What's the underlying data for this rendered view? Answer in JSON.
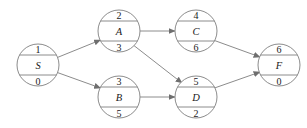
{
  "diagram": {
    "type": "activity-on-node-network",
    "background_color": "#ffffff",
    "node_stroke_color": "#8c8c8c",
    "edge_color": "#8c8c8c",
    "text_color": "#1a1a1a",
    "nodes": [
      {
        "id": "S",
        "top": "1",
        "middle": "S",
        "bottom": "0",
        "cx": 38,
        "cy": 65,
        "r": 21
      },
      {
        "id": "A",
        "top": "2",
        "middle": "A",
        "bottom": "3",
        "cx": 119,
        "cy": 31,
        "r": 21
      },
      {
        "id": "B",
        "top": "3",
        "middle": "B",
        "bottom": "5",
        "cx": 119,
        "cy": 97,
        "r": 21
      },
      {
        "id": "C",
        "top": "4",
        "middle": "C",
        "bottom": "6",
        "cx": 196,
        "cy": 31,
        "r": 21
      },
      {
        "id": "D",
        "top": "5",
        "middle": "D",
        "bottom": "2",
        "cx": 196,
        "cy": 97,
        "r": 21
      },
      {
        "id": "F",
        "top": "6",
        "middle": "F",
        "bottom": "0",
        "cx": 279,
        "cy": 65,
        "r": 21
      }
    ],
    "edges": [
      {
        "from": "S",
        "to": "A"
      },
      {
        "from": "S",
        "to": "B"
      },
      {
        "from": "A",
        "to": "C"
      },
      {
        "from": "A",
        "to": "D"
      },
      {
        "from": "B",
        "to": "D"
      },
      {
        "from": "C",
        "to": "F"
      },
      {
        "from": "D",
        "to": "F"
      }
    ]
  }
}
